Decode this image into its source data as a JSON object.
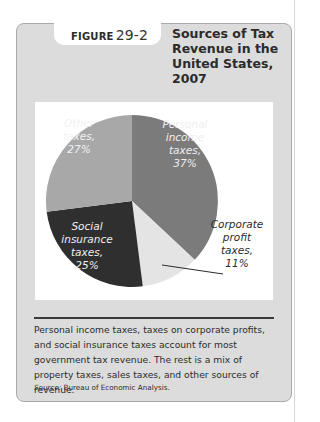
{
  "figure": {
    "label": "FIGURE",
    "number": "29-2",
    "title": "Sources of Tax Revenue in the United States, 2007"
  },
  "chart_data": {
    "type": "pie",
    "title": "Sources of Tax Revenue in the United States, 2007",
    "unit": "percent",
    "start": "top, clockwise",
    "slices": [
      {
        "name": "Personal income taxes",
        "value": 37,
        "label_lines": [
          "Personal",
          "income",
          "taxes,",
          "37%"
        ],
        "color": "#7b7b7b",
        "label_color": "#f0f0f0"
      },
      {
        "name": "Corporate profit taxes",
        "value": 11,
        "label_lines": [
          "Corporate",
          "profit",
          "taxes,",
          "11%"
        ],
        "color": "#e4e4e4",
        "label_color": "#2b2b2b",
        "callout": true
      },
      {
        "name": "Social insurance taxes",
        "value": 25,
        "label_lines": [
          "Social",
          "insurance",
          "taxes,",
          "25%"
        ],
        "color": "#2f2f2f",
        "label_color": "#f0f0f0"
      },
      {
        "name": "Other taxes",
        "value": 27,
        "label_lines": [
          "Other",
          "taxes,",
          "27%"
        ],
        "color": "#a8a8a8",
        "label_color": "#f2f2f2"
      }
    ]
  },
  "caption": "Personal income taxes, taxes on corporate profits, and social insurance taxes account for most government tax revenue. The rest is a mix of property taxes, sales taxes, and other sources of revenue.",
  "source": {
    "label": "Source:",
    "text": "Bureau of Economic Analysis."
  }
}
